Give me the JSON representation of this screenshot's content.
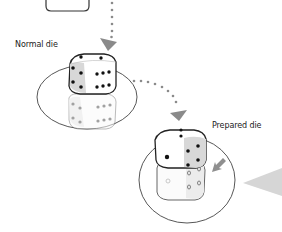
{
  "labels": {
    "normal_die": "Normal die",
    "prepared_die": "Prepared die"
  },
  "colors": {
    "outline": "#333333",
    "arrow": "#8a8a8a",
    "shade_face": "#d8d8d8",
    "pointer": "#d6d6d6"
  },
  "dice": {
    "normal": {
      "top_pips": 2,
      "left_pips": 4,
      "right_pips": 6,
      "has_reflection": true
    },
    "prepared": {
      "top_pips": 2,
      "left_pips": 1,
      "right_pips": 4,
      "has_ghost_below": true
    }
  }
}
